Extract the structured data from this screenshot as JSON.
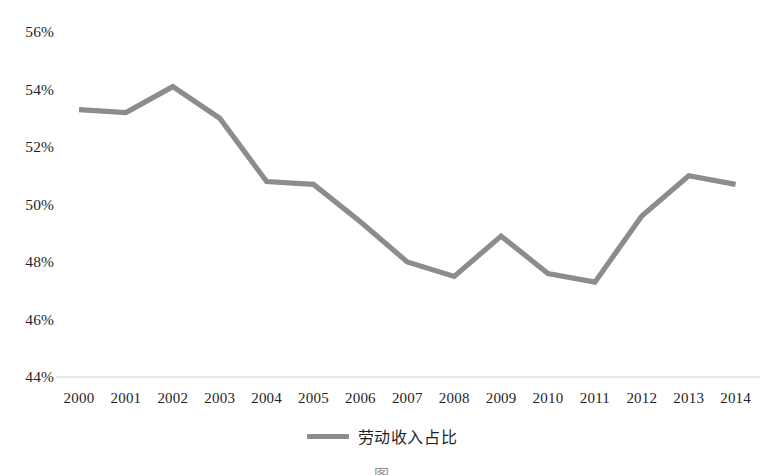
{
  "chart_data": {
    "type": "line",
    "title": "",
    "xlabel": "",
    "ylabel": "",
    "categories": [
      "2000",
      "2001",
      "2002",
      "2003",
      "2004",
      "2005",
      "2006",
      "2007",
      "2008",
      "2009",
      "2010",
      "2011",
      "2012",
      "2013",
      "2014"
    ],
    "series": [
      {
        "name": "劳动收入占比",
        "color": "#8c8c8c",
        "values": [
          53.3,
          53.2,
          54.1,
          53.0,
          50.8,
          50.7,
          49.4,
          48.0,
          47.5,
          48.9,
          47.6,
          47.3,
          49.6,
          51.0,
          50.7
        ]
      }
    ],
    "ylim": [
      44,
      56
    ],
    "yticks": [
      56,
      54,
      52,
      50,
      48,
      46,
      44
    ],
    "ytick_labels": [
      "56%",
      "54%",
      "52%",
      "50%",
      "48%",
      "46%",
      "44%"
    ],
    "xtick_labels": [
      "2000",
      "2001",
      "2002",
      "2003",
      "2004",
      "2005",
      "2006",
      "2007",
      "2008",
      "2009",
      "2010",
      "2011",
      "2012",
      "2013",
      "2014"
    ],
    "grid": false,
    "axis_line": true,
    "legend": {
      "position": "bottom",
      "entries": [
        "劳动收入占比"
      ]
    }
  },
  "legend": {
    "label": "劳动收入占比"
  },
  "caption": {
    "text": "图"
  },
  "colors": {
    "line": "#8c8c8c",
    "axis": "#d0d0d0",
    "text": "#1f1f1f",
    "background": "#ffffff"
  }
}
